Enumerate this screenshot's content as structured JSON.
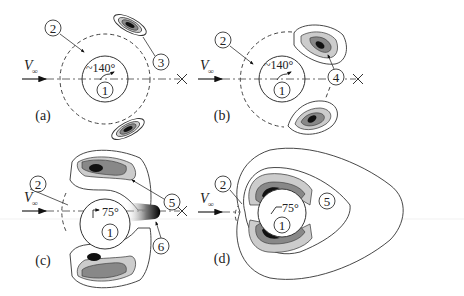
{
  "figure": {
    "panels": [
      {
        "id": "a",
        "caption": "(a)",
        "angle": "~140°",
        "velocity_symbol": "V",
        "velocity_subscript": "∞",
        "callouts": [
          "2",
          "3",
          "1"
        ]
      },
      {
        "id": "b",
        "caption": "(b)",
        "angle": "~140°",
        "velocity_symbol": "V",
        "velocity_subscript": "∞",
        "callouts": [
          "2",
          "4",
          "1"
        ]
      },
      {
        "id": "c",
        "caption": "(c)",
        "angle": "75°",
        "velocity_symbol": "V",
        "velocity_subscript": "∞",
        "callouts": [
          "2",
          "5",
          "6",
          "1"
        ]
      },
      {
        "id": "d",
        "caption": "(d)",
        "angle": "75°",
        "velocity_symbol": "V",
        "velocity_subscript": "∞",
        "callouts": [
          "2",
          "5",
          "1"
        ]
      }
    ],
    "colors": {
      "line": "#333333",
      "contour_light": "#d4d4d4",
      "contour_mid": "#9a9a9a",
      "contour_core": "#111111"
    }
  }
}
